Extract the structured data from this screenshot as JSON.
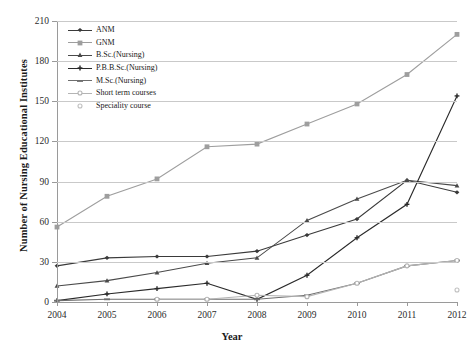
{
  "chart_data": {
    "type": "line",
    "title": "",
    "xlabel": "Year",
    "ylabel": "Number of Nursing Educational Institutes",
    "categories": [
      "2004",
      "2005",
      "2006",
      "2007",
      "2008",
      "2009",
      "2010",
      "2011",
      "2012"
    ],
    "x": [
      2004,
      2005,
      2006,
      2007,
      2008,
      2009,
      2010,
      2011,
      2012
    ],
    "ylim": [
      0,
      210
    ],
    "yticks": [
      0,
      30,
      60,
      90,
      120,
      150,
      180,
      210
    ],
    "grid": true,
    "legend_position": "top-left",
    "series": [
      {
        "name": "ANM",
        "color": "#3a3a3a",
        "marker": "diamond",
        "values": [
          27,
          33,
          34,
          34,
          38,
          50,
          62,
          91,
          82
        ]
      },
      {
        "name": "GNM",
        "color": "#9e9e9e",
        "marker": "square",
        "values": [
          56,
          79,
          92,
          116,
          118,
          133,
          148,
          170,
          200
        ]
      },
      {
        "name": "B.Sc.(Nursing)",
        "color": "#4a4a4a",
        "marker": "triangle",
        "values": [
          12,
          16,
          22,
          29,
          33,
          61,
          77,
          91,
          87
        ]
      },
      {
        "name": "P.B.B.Sc.(Nursing)",
        "color": "#2a2a2a",
        "marker": "cross",
        "values": [
          1,
          6,
          10,
          14,
          2,
          20,
          48,
          73,
          154
        ]
      },
      {
        "name": "M.Sc.(Nursing)",
        "color": "#6e6e6e",
        "marker": "dash",
        "values": [
          1,
          2,
          2,
          2,
          2,
          5,
          14,
          27,
          31
        ]
      },
      {
        "name": "Short term courses",
        "color": "#b4b4b4",
        "marker": "circle",
        "values": [
          null,
          null,
          2,
          2,
          5,
          4,
          14,
          27,
          31
        ]
      },
      {
        "name": "Speciality course",
        "color": "#c0c0c0",
        "marker": "dot",
        "values": [
          null,
          null,
          null,
          null,
          null,
          null,
          null,
          null,
          9
        ]
      }
    ]
  },
  "legend": {
    "items": [
      {
        "label": "ANM"
      },
      {
        "label": "GNM"
      },
      {
        "label": "B.Sc.(Nursing)"
      },
      {
        "label": "P.B.B.Sc.(Nursing)"
      },
      {
        "label": "M.Sc.(Nursing)"
      },
      {
        "label": "Short term courses"
      },
      {
        "label": "Speciality course"
      }
    ]
  },
  "axes": {
    "y_title": "Number of Nursing Educational Institutes",
    "x_title": "Year",
    "y_tick_labels": [
      "0",
      "30",
      "60",
      "90",
      "120",
      "150",
      "180",
      "210"
    ],
    "x_tick_labels": [
      "2004",
      "2005",
      "2006",
      "2007",
      "2008",
      "2009",
      "2010",
      "2011",
      "2012"
    ]
  }
}
